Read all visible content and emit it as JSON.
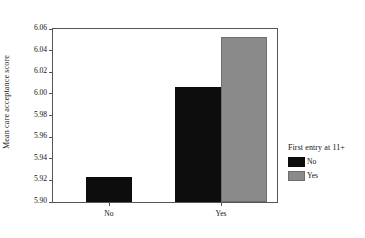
{
  "chart_data": {
    "type": "bar",
    "title": "",
    "xlabel": "",
    "ylabel": "Mean care acceptance score",
    "categories": [
      "No",
      "Yes"
    ],
    "ylim": [
      5.9,
      6.06
    ],
    "yticks": [
      "5.90",
      "5.92",
      "5.94",
      "5.96",
      "5.98",
      "6.00",
      "6.02",
      "6.04",
      "6.06"
    ],
    "grid": false,
    "legend": {
      "title": "First entry at 11+",
      "position": "right",
      "entries": [
        {
          "label": "No",
          "color": "#0d0d0d"
        },
        {
          "label": "Yes",
          "color": "#8a8a8a"
        }
      ]
    },
    "series": [
      {
        "name": "No",
        "color": "#0d0d0d",
        "values": [
          5.923,
          6.006
        ]
      },
      {
        "name": "Yes",
        "color": "#8a8a8a",
        "values": [
          null,
          6.053
        ]
      }
    ]
  }
}
